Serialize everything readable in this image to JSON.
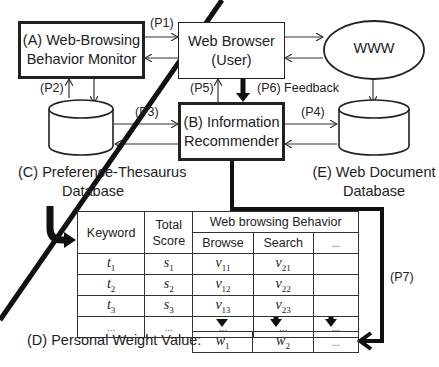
{
  "nodes": {
    "monitor": {
      "line1": "(A) Web-Browsing",
      "line2": "Behavior Monitor"
    },
    "browser": {
      "line1": "Web Browser",
      "line2": "(User)"
    },
    "www": {
      "label": "WWW"
    },
    "recommender": {
      "line1": "(B) Information",
      "line2": "Recommender"
    },
    "thesaurus_db": {
      "line1": "(C) Preference-Thesaurus",
      "line2": "Database"
    },
    "webdoc_db": {
      "line1": "(E) Web Document",
      "line2": "Database"
    }
  },
  "edges": {
    "p1": "(P1)",
    "p2": "(P2)",
    "p3": "(P3)",
    "p4": "(P4)",
    "p5": "(P5)",
    "p6": "(P6) Feedback",
    "p7": "(P7)"
  },
  "table": {
    "headers": {
      "keyword": "Keyword",
      "total_score_1": "Total",
      "total_score_2": "Score",
      "behavior_group": "Web browsing Behavior",
      "browse": "Browse",
      "search": "Search",
      "more": "..."
    },
    "rows": [
      {
        "keyword": "t",
        "ksub": "1",
        "score": "s",
        "ssub": "1",
        "browse": "v",
        "bsub": "11",
        "search": "v",
        "srsub": "21",
        "more": ""
      },
      {
        "keyword": "t",
        "ksub": "2",
        "score": "s",
        "ssub": "2",
        "browse": "v",
        "bsub": "12",
        "search": "v",
        "srsub": "22",
        "more": ""
      },
      {
        "keyword": "t",
        "ksub": "3",
        "score": "s",
        "ssub": "3",
        "browse": "v",
        "bsub": "13",
        "search": "v",
        "srsub": "23",
        "more": ""
      },
      {
        "keyword": "...",
        "ksub": "",
        "score": "...",
        "ssub": "",
        "browse": "...",
        "bsub": "",
        "search": "...",
        "srsub": "",
        "more": "..."
      }
    ]
  },
  "weights": {
    "label": "(D) Personal Weight Value:",
    "w1": "w",
    "w1sub": "1",
    "w2": "w",
    "w2sub": "2",
    "more": "..."
  }
}
